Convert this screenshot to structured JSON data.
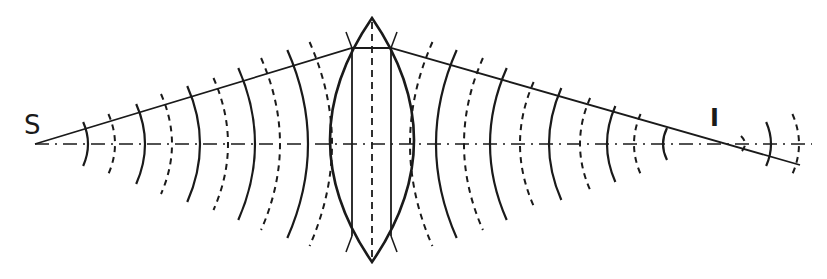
{
  "diagram": {
    "title": "",
    "labels": {
      "source": "S",
      "image": "I"
    },
    "colors": {
      "ink": "#1a1a1a",
      "background": "#ffffff"
    },
    "geometry": {
      "source_point": [
        35,
        144
      ],
      "image_point": [
        713,
        140
      ],
      "axis_y": 144,
      "lens": {
        "center_x": 372,
        "top": [
          372,
          18
        ],
        "bottom": [
          372,
          262
        ],
        "half_width": 42,
        "inner_lines_x": [
          352,
          391
        ]
      },
      "ray": {
        "points": [
          [
            35,
            144
          ],
          [
            352,
            48
          ],
          [
            391,
            48
          ],
          [
            800,
            165
          ]
        ]
      },
      "wavefronts_left": [
        {
          "x": 88,
          "style": "solid",
          "h": 22
        },
        {
          "x": 115,
          "style": "dashed",
          "h": 30
        },
        {
          "x": 145,
          "style": "solid",
          "h": 40
        },
        {
          "x": 172,
          "style": "dashed",
          "h": 50
        },
        {
          "x": 200,
          "style": "solid",
          "h": 58
        },
        {
          "x": 228,
          "style": "dashed",
          "h": 66
        },
        {
          "x": 255,
          "style": "solid",
          "h": 76
        },
        {
          "x": 280,
          "style": "dashed",
          "h": 86
        },
        {
          "x": 308,
          "style": "solid",
          "h": 94
        },
        {
          "x": 332,
          "style": "dashed",
          "h": 102
        }
      ],
      "wavefronts_right": [
        {
          "x": 410,
          "style": "dashed",
          "h": 102
        },
        {
          "x": 436,
          "style": "solid",
          "h": 94
        },
        {
          "x": 464,
          "style": "dashed",
          "h": 86
        },
        {
          "x": 490,
          "style": "solid",
          "h": 76
        },
        {
          "x": 520,
          "style": "dashed",
          "h": 62
        },
        {
          "x": 549,
          "style": "solid",
          "h": 56
        },
        {
          "x": 580,
          "style": "dashed",
          "h": 46
        },
        {
          "x": 607,
          "style": "solid",
          "h": 38
        },
        {
          "x": 634,
          "style": "dashed",
          "h": 30
        },
        {
          "x": 663,
          "style": "solid",
          "h": 16
        }
      ],
      "wavefronts_beyond": [
        {
          "x": 745,
          "style": "dashed",
          "h": 8
        },
        {
          "x": 771,
          "style": "solid",
          "h": 22
        },
        {
          "x": 799,
          "style": "dashed",
          "h": 30
        }
      ]
    }
  }
}
